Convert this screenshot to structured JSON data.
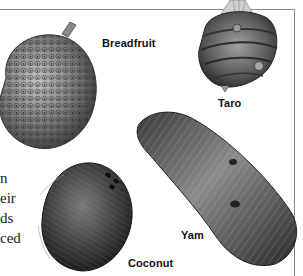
{
  "page": {
    "labels": {
      "breadfruit": "Breadfruit",
      "taro": "Taro",
      "yam": "Yam",
      "coconut": "Coconut"
    },
    "body_text_fragments": [
      "n",
      "eir",
      "ds",
      "ced"
    ],
    "colors": {
      "rule": "#8a8a8a",
      "label_text": "#111111",
      "illustration_dark": "#2a2a2a",
      "illustration_mid": "#6e6e6e",
      "illustration_light": "#b8b8b8"
    }
  }
}
